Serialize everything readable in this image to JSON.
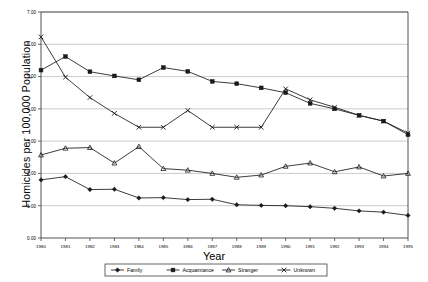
{
  "chart_data": {
    "type": "line",
    "title": "",
    "xlabel": "Year",
    "ylabel": "Homicides per 100,000 Population",
    "x": [
      1980,
      1981,
      1982,
      1983,
      1984,
      1985,
      1986,
      1987,
      1988,
      1989,
      1990,
      1991,
      1992,
      1993,
      1994,
      1995
    ],
    "categories": [
      "1980",
      "1981",
      "1982",
      "1983",
      "1984",
      "1985",
      "1986",
      "1987",
      "1988",
      "1989",
      "1990",
      "1991",
      "1992",
      "1993",
      "1994",
      "1995"
    ],
    "ylim": [
      0.0,
      7.0
    ],
    "yticks": [
      0.0,
      1.0,
      2.0,
      3.0,
      4.0,
      5.0,
      6.0,
      7.0
    ],
    "ytick_labels": [
      "0.00",
      "1.00",
      "2.00",
      "3.00",
      "4.00",
      "5.00",
      "6.00",
      "7.00"
    ],
    "grid": true,
    "legend_position": "bottom",
    "series": [
      {
        "name": "Family",
        "marker": "diamond",
        "values": [
          1.8,
          1.9,
          1.5,
          1.51,
          1.24,
          1.25,
          1.19,
          1.2,
          1.03,
          1.01,
          1.0,
          0.97,
          0.92,
          0.84,
          0.8,
          0.7
        ]
      },
      {
        "name": "Acquaintance",
        "marker": "square",
        "values": [
          5.2,
          5.62,
          5.15,
          5.02,
          4.9,
          5.28,
          5.16,
          4.85,
          4.78,
          4.65,
          4.5,
          4.17,
          4.0,
          3.8,
          3.62,
          3.2
        ]
      },
      {
        "name": "Stranger",
        "marker": "triangle",
        "values": [
          2.57,
          2.78,
          2.8,
          2.32,
          2.83,
          2.15,
          2.1,
          2.0,
          1.88,
          1.95,
          2.22,
          2.32,
          2.05,
          2.2,
          1.92,
          2.0
        ]
      },
      {
        "name": "Unknown",
        "marker": "x",
        "values": [
          6.23,
          4.98,
          4.35,
          3.86,
          3.43,
          3.43,
          3.95,
          3.43,
          3.43,
          3.43,
          4.62,
          4.28,
          4.05,
          3.8,
          3.62,
          3.25
        ]
      }
    ]
  },
  "axis": {
    "ylabel": "Homicides per 100,000 Population",
    "xlabel": "Year"
  },
  "legend": {
    "items": [
      {
        "label": "Family",
        "marker": "diamond"
      },
      {
        "label": "Acquaintance",
        "marker": "square"
      },
      {
        "label": "Stranger",
        "marker": "triangle"
      },
      {
        "label": "Unknown",
        "marker": "x"
      }
    ]
  },
  "colors": {
    "line": "#1a1a1a",
    "grid": "#b5b5b5",
    "axis": "#404040",
    "background": "#ffffff"
  }
}
